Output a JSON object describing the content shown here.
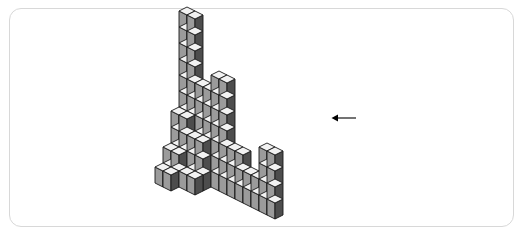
{
  "card": {
    "background": "#ffffff",
    "border_color": "#d8d8d8",
    "corner_radius": 12,
    "x": 9,
    "y": 8,
    "width": 505,
    "height": 219
  },
  "figure": {
    "description": "Stack of unit cubes drawn in isometric projection",
    "projection": "isometric",
    "cube": {
      "half_width": 8,
      "rise": 4,
      "height": 16
    },
    "origin": {
      "x": 187,
      "y": 175
    },
    "colors": {
      "top_face": "#f2f2f2",
      "left_face": "#9b9b9b",
      "right_face": "#4d4d4d",
      "outline": "#1a1a1a"
    },
    "outline_width": 0.9,
    "cubes": [
      {
        "x": 0,
        "y": 0,
        "z": 0
      },
      {
        "x": 0,
        "y": 0,
        "z": 1
      },
      {
        "x": 0,
        "y": 0,
        "z": 2
      },
      {
        "x": 0,
        "y": 0,
        "z": 3
      },
      {
        "x": 0,
        "y": 0,
        "z": 4
      },
      {
        "x": 0,
        "y": 0,
        "z": 5
      },
      {
        "x": 0,
        "y": 0,
        "z": 6
      },
      {
        "x": 0,
        "y": 0,
        "z": 7
      },
      {
        "x": 0,
        "y": 0,
        "z": 8
      },
      {
        "x": 0,
        "y": 0,
        "z": 9
      },
      {
        "x": 1,
        "y": 0,
        "z": 0
      },
      {
        "x": 1,
        "y": 0,
        "z": 1
      },
      {
        "x": 1,
        "y": 0,
        "z": 2
      },
      {
        "x": 1,
        "y": 0,
        "z": 3
      },
      {
        "x": 1,
        "y": 0,
        "z": 4
      },
      {
        "x": 1,
        "y": 0,
        "z": 5
      },
      {
        "x": 1,
        "y": 0,
        "z": 6
      },
      {
        "x": 1,
        "y": 0,
        "z": 7
      },
      {
        "x": 1,
        "y": 0,
        "z": 8
      },
      {
        "x": 1,
        "y": 0,
        "z": 9
      },
      {
        "x": 0,
        "y": 1,
        "z": 0
      },
      {
        "x": 0,
        "y": 1,
        "z": 1
      },
      {
        "x": 0,
        "y": 1,
        "z": 2
      },
      {
        "x": 0,
        "y": 1,
        "z": 3
      },
      {
        "x": 1,
        "y": 1,
        "z": 0
      },
      {
        "x": 1,
        "y": 1,
        "z": 1
      },
      {
        "x": 1,
        "y": 1,
        "z": 2
      },
      {
        "x": 1,
        "y": 1,
        "z": 3
      },
      {
        "x": 0,
        "y": 2,
        "z": 0
      },
      {
        "x": 0,
        "y": 2,
        "z": 1
      },
      {
        "x": 1,
        "y": 2,
        "z": 0
      },
      {
        "x": 1,
        "y": 2,
        "z": 1
      },
      {
        "x": 0,
        "y": 3,
        "z": 0
      },
      {
        "x": 1,
        "y": 3,
        "z": 0
      },
      {
        "x": 2,
        "y": 0,
        "z": 0
      },
      {
        "x": 2,
        "y": 0,
        "z": 1
      },
      {
        "x": 2,
        "y": 0,
        "z": 2
      },
      {
        "x": 2,
        "y": 0,
        "z": 3
      },
      {
        "x": 2,
        "y": 0,
        "z": 4
      },
      {
        "x": 2,
        "y": 0,
        "z": 5
      },
      {
        "x": 3,
        "y": 0,
        "z": 0
      },
      {
        "x": 3,
        "y": 0,
        "z": 1
      },
      {
        "x": 3,
        "y": 0,
        "z": 2
      },
      {
        "x": 3,
        "y": 0,
        "z": 3
      },
      {
        "x": 3,
        "y": 0,
        "z": 4
      },
      {
        "x": 3,
        "y": 0,
        "z": 5
      },
      {
        "x": 2,
        "y": 1,
        "z": 0
      },
      {
        "x": 2,
        "y": 1,
        "z": 1
      },
      {
        "x": 2,
        "y": 1,
        "z": 2
      },
      {
        "x": 3,
        "y": 1,
        "z": 0
      },
      {
        "x": 3,
        "y": 1,
        "z": 1
      },
      {
        "x": 3,
        "y": 1,
        "z": 2
      },
      {
        "x": 2,
        "y": 2,
        "z": 0
      },
      {
        "x": 3,
        "y": 2,
        "z": 0
      },
      {
        "x": 4,
        "y": 0,
        "z": 0
      },
      {
        "x": 4,
        "y": 0,
        "z": 1
      },
      {
        "x": 4,
        "y": 0,
        "z": 2
      },
      {
        "x": 4,
        "y": 0,
        "z": 3
      },
      {
        "x": 4,
        "y": 0,
        "z": 4
      },
      {
        "x": 4,
        "y": 0,
        "z": 5
      },
      {
        "x": 4,
        "y": 0,
        "z": 6
      },
      {
        "x": 5,
        "y": 0,
        "z": 0
      },
      {
        "x": 5,
        "y": 0,
        "z": 1
      },
      {
        "x": 5,
        "y": 0,
        "z": 2
      },
      {
        "x": 5,
        "y": 0,
        "z": 3
      },
      {
        "x": 5,
        "y": 0,
        "z": 4
      },
      {
        "x": 5,
        "y": 0,
        "z": 5
      },
      {
        "x": 5,
        "y": 0,
        "z": 6
      },
      {
        "x": 6,
        "y": 0,
        "z": 0
      },
      {
        "x": 6,
        "y": 0,
        "z": 1
      },
      {
        "x": 6,
        "y": 0,
        "z": 2
      },
      {
        "x": 7,
        "y": 0,
        "z": 0
      },
      {
        "x": 7,
        "y": 0,
        "z": 1
      },
      {
        "x": 7,
        "y": 0,
        "z": 2
      },
      {
        "x": 8,
        "y": 0,
        "z": 0
      },
      {
        "x": 8,
        "y": 0,
        "z": 1
      },
      {
        "x": 9,
        "y": 0,
        "z": 0
      },
      {
        "x": 9,
        "y": 0,
        "z": 1
      },
      {
        "x": 10,
        "y": 0,
        "z": 0
      },
      {
        "x": 10,
        "y": 0,
        "z": 1
      },
      {
        "x": 10,
        "y": 0,
        "z": 2
      },
      {
        "x": 10,
        "y": 0,
        "z": 3
      },
      {
        "x": 11,
        "y": 0,
        "z": 0
      },
      {
        "x": 11,
        "y": 0,
        "z": 1
      },
      {
        "x": 11,
        "y": 0,
        "z": 2
      },
      {
        "x": 11,
        "y": 0,
        "z": 3
      }
    ]
  },
  "arrow": {
    "name": "left-arrow",
    "direction": "left",
    "color": "#000000",
    "x": 331,
    "y": 110,
    "length": 22,
    "glyph": "←"
  }
}
